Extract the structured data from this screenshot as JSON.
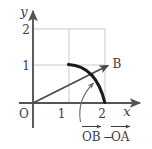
{
  "figure": {
    "kind": "vector-diagram",
    "background_color": "#ffffff",
    "axes": {
      "x_axis_label": "x",
      "y_axis_label": "y",
      "origin_label": "O",
      "axis_color": "#555555",
      "grid_color": "#c8c8c8",
      "x_ticks": [
        {
          "value": 1,
          "label": "1"
        },
        {
          "value": 2,
          "label": "2"
        }
      ],
      "y_ticks": [
        {
          "value": 1,
          "label": "1"
        },
        {
          "value": 2,
          "label": "2"
        }
      ],
      "xlim": [
        0,
        2.6
      ],
      "ylim": [
        0,
        2.4
      ],
      "grid": true
    },
    "points": [
      {
        "name": "B",
        "label": "B",
        "x": 2,
        "y": 1
      }
    ],
    "vectors": [
      {
        "name": "OB",
        "from": [
          0,
          0
        ],
        "to": [
          2,
          1
        ],
        "color": "#4a4a4a"
      }
    ],
    "arc": {
      "name": "rotation-arc",
      "from": [
        1,
        1
      ],
      "to": [
        2,
        0
      ],
      "color": "#1a1a1a",
      "description": "thick arc sweeping from (1,1) to (2,0)"
    },
    "leader": {
      "name": "leader-arrow",
      "color": "#6b6b6b",
      "description": "thin curved arrow from caption up to the arc"
    },
    "caption": {
      "term_1": "OB",
      "operator": "−",
      "term_2": "OA",
      "overline_arrow": "→"
    }
  }
}
